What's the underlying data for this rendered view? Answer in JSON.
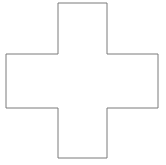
{
  "canvas": {
    "width": 166,
    "height": 165,
    "background_color": "#ffffff",
    "name": "cross-shape-canvas"
  },
  "shape": {
    "kind": "greek-cross",
    "label": "cross",
    "fill_color": "#ffffff",
    "stroke_color": "#7a7a7a",
    "stroke_width": 1,
    "bounds": {
      "left": 6,
      "top": 3,
      "right": 158,
      "bottom": 158,
      "width": 152,
      "height": 155
    },
    "vertical_bar": {
      "x_left": 58,
      "x_right": 107,
      "y_top": 3,
      "y_bottom": 158,
      "width": 49
    },
    "horizontal_bar": {
      "y_top": 54,
      "y_bottom": 108,
      "x_left": 6,
      "x_right": 158,
      "height": 54
    },
    "points": [
      [
        58,
        3
      ],
      [
        107,
        3
      ],
      [
        107,
        54
      ],
      [
        158,
        54
      ],
      [
        158,
        108
      ],
      [
        107,
        108
      ],
      [
        107,
        158
      ],
      [
        58,
        158
      ],
      [
        58,
        108
      ],
      [
        6,
        108
      ],
      [
        6,
        54
      ],
      [
        58,
        54
      ]
    ],
    "path_d": "M58,3 L107,3 L107,54 L158,54 L158,108 L107,108 L107,158 L58,158 L58,108 L6,108 L6,54 L58,54 Z"
  }
}
